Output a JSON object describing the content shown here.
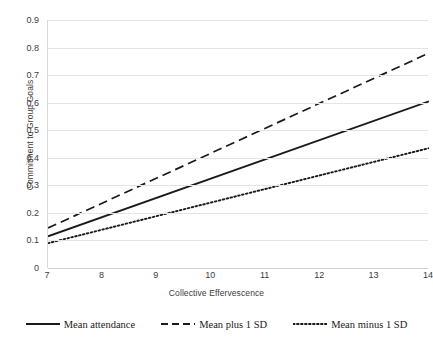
{
  "chart_data": {
    "type": "line",
    "title": "",
    "xlabel": "Collective Effervescence",
    "ylabel": "Commitment to Group Goals",
    "xlim": [
      7,
      14
    ],
    "ylim": [
      0,
      0.9
    ],
    "grid": true,
    "legend_position": "bottom",
    "x_ticks": [
      "7",
      "8",
      "9",
      "10",
      "11",
      "12",
      "13",
      "14"
    ],
    "y_ticks": [
      "0",
      "0.1",
      "0.2",
      "0.3",
      "0.4",
      "0.5",
      "0.6",
      "0.7",
      "0.8",
      "0.9"
    ],
    "x": [
      7,
      14
    ],
    "series": [
      {
        "name": "Mean attendance",
        "style": "solid",
        "color": "#1a1a1a",
        "values": [
          0.115,
          0.605
        ]
      },
      {
        "name": "Mean plus 1 SD",
        "style": "dashed",
        "color": "#1a1a1a",
        "values": [
          0.145,
          0.78
        ]
      },
      {
        "name": "Mean minus 1 SD",
        "style": "dotted",
        "color": "#1a1a1a",
        "values": [
          0.09,
          0.435
        ]
      }
    ]
  },
  "legend": {
    "items": [
      {
        "label": "Mean attendance"
      },
      {
        "label": "Mean plus 1 SD"
      },
      {
        "label": "Mean minus 1 SD"
      }
    ]
  },
  "colors": {
    "line": "#1a1a1a",
    "grid": "#e4e4e4",
    "axis": "#d9d9d9",
    "text": "#3c3c3c",
    "background": "#ffffff"
  }
}
